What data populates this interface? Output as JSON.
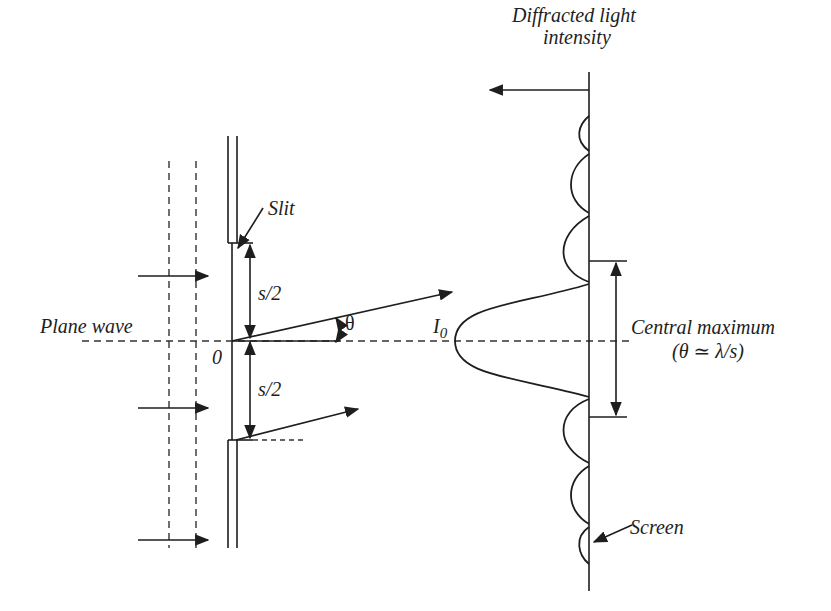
{
  "diagram": {
    "labels": {
      "intensity_line1": "Diffracted light",
      "intensity_line2": "intensity",
      "slit": "Slit",
      "half_width_top": "s/2",
      "half_width_bottom": "s/2",
      "theta": "θ",
      "origin": "0",
      "plane_wave": "Plane wave",
      "peak_intensity": "I",
      "peak_intensity_sub": "0",
      "central_max_line1": "Central maximum",
      "central_max_line2": "(θ ≃ λ/s)",
      "screen": "Screen"
    },
    "colors": {
      "ink": "#1e1e1e",
      "background": "#ffffff"
    }
  }
}
